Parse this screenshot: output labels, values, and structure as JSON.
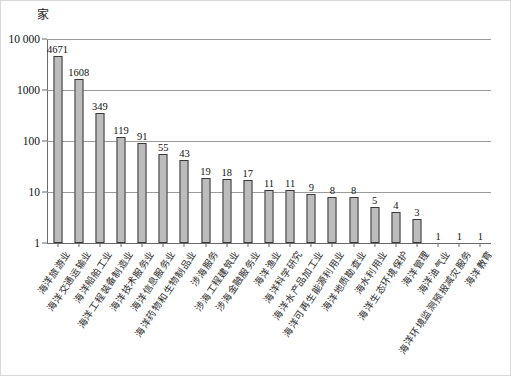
{
  "unit": "家",
  "chart_data": {
    "type": "bar",
    "title": "",
    "subtitle": "",
    "xlabel": "",
    "ylabel": "家",
    "yscale": "log",
    "ylim": [
      1,
      10000
    ],
    "ytick_labels": [
      "10 000",
      "1000",
      "100",
      "10",
      "1"
    ],
    "ytick_values": [
      10000,
      1000,
      100,
      10,
      1
    ],
    "grid": true,
    "legend": "none",
    "categories": [
      "海洋旅游业",
      "海洋交通运输业",
      "海洋船舶工业",
      "海洋工程装备制造业",
      "海洋技术服务业",
      "海洋信息服务业",
      "海洋药物和生物制品业",
      "涉海服务",
      "涉海工程建筑业",
      "涉海金融服务业",
      "海洋渔业",
      "海洋科学研究",
      "海洋水产品加工业",
      "海洋可再生能源利用业",
      "海洋地质勘查业",
      "海水利用业",
      "海洋生态环境保护",
      "海洋管理",
      "海洋油气业",
      "海洋环境监测预报减灾服务",
      "海洋教育"
    ],
    "values": [
      4671,
      1608,
      349,
      119,
      91,
      55,
      43,
      19,
      18,
      17,
      11,
      11,
      9,
      8,
      8,
      5,
      4,
      3,
      1,
      1,
      1
    ],
    "value_labels": [
      "4671",
      "1608",
      "349",
      "119",
      "91",
      "55",
      "43",
      "19",
      "18",
      "17",
      "11",
      "11",
      "9",
      "8",
      "8",
      "5",
      "4",
      "3",
      "1",
      "1",
      "1"
    ],
    "bar_fill_color": "#bcbcbc",
    "bar_edge_color": "#3a3a3a",
    "gridline_color": "#9a9a9a"
  }
}
